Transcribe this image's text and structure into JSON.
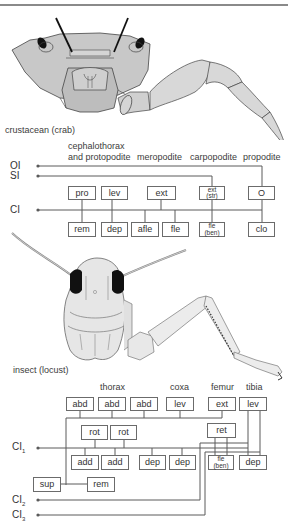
{
  "crab": {
    "caption": "crustacean (crab)",
    "segments": {
      "seg1_line1": "cephalothorax",
      "seg1_line2": "and protopodite",
      "seg2": "meropodite",
      "seg3": "carpopodite",
      "seg4": "propodite"
    },
    "nerves": {
      "oi": "OI",
      "si": "SI",
      "ci": "CI"
    },
    "top_row": [
      {
        "label": "pro"
      },
      {
        "label": "lev"
      },
      {
        "label": "ext"
      },
      {
        "label": "ext",
        "sub": "(str)"
      },
      {
        "label": "O"
      }
    ],
    "bottom_row": [
      {
        "label": "rem"
      },
      {
        "label": "dep"
      },
      {
        "label": "afle"
      },
      {
        "label": "fle"
      },
      {
        "label": "fle",
        "sub": "(ben)"
      },
      {
        "label": "clo"
      }
    ]
  },
  "locust": {
    "caption": "insect (locust)",
    "segments": {
      "thorax": "thorax",
      "coxa": "coxa",
      "femur": "femur",
      "tibia": "tibia"
    },
    "nerves": {
      "ci1": "CI",
      "ci1_sub": "1",
      "ci2": "CI",
      "ci2_sub": "2",
      "ci3": "CI",
      "ci3_sub": "3"
    },
    "top_row": [
      {
        "label": "abd"
      },
      {
        "label": "abd"
      },
      {
        "label": "abd"
      },
      {
        "label": "lev"
      },
      {
        "label": "ext"
      },
      {
        "label": "lev"
      }
    ],
    "middle_row": [
      {
        "label": "rot"
      },
      {
        "label": "rot"
      },
      {
        "label": "ret"
      }
    ],
    "lower_row": [
      {
        "label": "add"
      },
      {
        "label": "add"
      },
      {
        "label": "dep"
      },
      {
        "label": "dep"
      },
      {
        "label": "fle",
        "sub": "(ben)"
      },
      {
        "label": "dep"
      }
    ],
    "bottom_row": [
      {
        "label": "sup"
      },
      {
        "label": "rem"
      }
    ]
  },
  "colors": {
    "body_fill": "#c9c9c9",
    "limb_fill": "#d8d8d8",
    "line": "#5a5a5a",
    "eye": "#111111"
  }
}
